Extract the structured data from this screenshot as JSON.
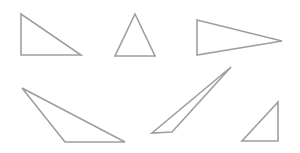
{
  "diagram": {
    "width": 300,
    "height": 153,
    "background": "#ffffff",
    "stroke_color": "#9e9e9e",
    "stroke_width": 1.6,
    "fill": "none",
    "shapes": [
      {
        "name": "triangle-right-angle-top-left",
        "kind": "right triangle",
        "points": [
          [
            21,
            14
          ],
          [
            21,
            55
          ],
          [
            81,
            55
          ]
        ]
      },
      {
        "name": "triangle-isosceles-acute",
        "kind": "acute isosceles triangle",
        "points": [
          [
            135,
            14
          ],
          [
            115,
            56
          ],
          [
            155,
            56
          ]
        ]
      },
      {
        "name": "triangle-pointing-right",
        "kind": "acute isosceles triangle",
        "points": [
          [
            197,
            20
          ],
          [
            197,
            55
          ],
          [
            282,
            41
          ]
        ]
      },
      {
        "name": "triangle-obtuse",
        "kind": "obtuse scalene triangle",
        "points": [
          [
            22,
            88
          ],
          [
            65,
            142
          ],
          [
            125,
            142
          ]
        ]
      },
      {
        "name": "triangle-sliver-obtuse",
        "kind": "obtuse scalene triangle",
        "points": [
          [
            231,
            67
          ],
          [
            152,
            133
          ],
          [
            172,
            132
          ]
        ]
      },
      {
        "name": "triangle-right-angle-bottom-right",
        "kind": "right triangle",
        "points": [
          [
            278,
            102
          ],
          [
            278,
            141
          ],
          [
            242,
            141
          ]
        ]
      }
    ]
  }
}
